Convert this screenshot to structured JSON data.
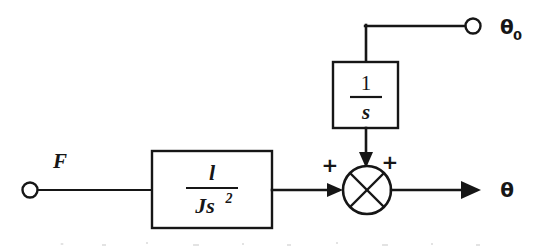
{
  "diagram": {
    "type": "control-block-diagram",
    "line_color": "#161616",
    "background_color": "#ffffff",
    "inputs": [
      {
        "id": "F",
        "label": "F",
        "terminal": "open-circle",
        "position": "left"
      },
      {
        "id": "theta0",
        "label": "θ",
        "subscript": "0",
        "terminal": "open-circle",
        "position": "top-right"
      }
    ],
    "outputs": [
      {
        "id": "theta",
        "label": "θ",
        "terminal": "arrow",
        "position": "right"
      }
    ],
    "blocks": [
      {
        "id": "plant",
        "numerator": "l",
        "denominator_base": "Js",
        "denominator_exponent": "2",
        "transfer_function": "l/Js²",
        "shape": "rectangle"
      },
      {
        "id": "integrator",
        "numerator": "1",
        "denominator_base": "s",
        "denominator_exponent": "",
        "transfer_function": "1/s",
        "shape": "rectangle"
      }
    ],
    "summing_junction": {
      "id": "summer",
      "style": "circle-with-x",
      "signs": [
        {
          "id": "sign-left",
          "label": "+",
          "port": "left-input"
        },
        {
          "id": "sign-top",
          "label": "+",
          "port": "top-input"
        }
      ]
    },
    "signal_paths": [
      {
        "from": "F",
        "to": "plant",
        "direction": "right"
      },
      {
        "from": "plant",
        "to": "summer",
        "direction": "right",
        "arrow": true
      },
      {
        "from": "theta0",
        "to": "integrator",
        "direction": "left-then-down"
      },
      {
        "from": "integrator",
        "to": "summer",
        "direction": "down",
        "arrow": true
      },
      {
        "from": "summer",
        "to": "theta",
        "direction": "right",
        "arrow": true
      }
    ]
  }
}
